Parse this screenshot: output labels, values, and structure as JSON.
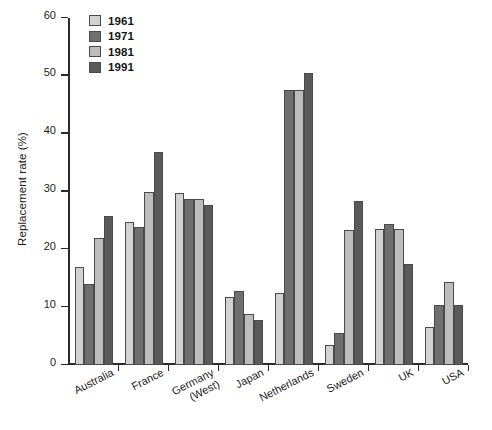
{
  "chart_data": {
    "type": "bar",
    "title": "",
    "xlabel": "",
    "ylabel": "Replacement rate (%)",
    "ylim": [
      0,
      60
    ],
    "yticks": [
      0,
      10,
      20,
      30,
      40,
      50,
      60
    ],
    "ytick_labels": [
      "0",
      "10",
      "20",
      "30",
      "40",
      "50",
      "60"
    ],
    "grid": false,
    "legend_position": "top-left",
    "categories": [
      "Australia",
      "France",
      "Germany\n(West)",
      "Japan",
      "Netherlands",
      "Sweden",
      "UK",
      "USA"
    ],
    "series": [
      {
        "name": "1961",
        "color": "#d2d2d2",
        "values": [
          17.0,
          24.8,
          29.8,
          11.8,
          12.5,
          3.5,
          23.5,
          6.5
        ]
      },
      {
        "name": "1971",
        "color": "#6f6f6f",
        "values": [
          14.0,
          23.8,
          28.7,
          12.8,
          47.5,
          5.5,
          24.3,
          10.4
        ]
      },
      {
        "name": "1981",
        "color": "#bdbdbd",
        "values": [
          21.9,
          29.9,
          28.7,
          8.8,
          47.5,
          23.4,
          23.5,
          14.4
        ]
      },
      {
        "name": "1991",
        "color": "#5a5a5a",
        "values": [
          25.8,
          36.8,
          27.6,
          7.8,
          50.5,
          28.4,
          17.4,
          10.4
        ]
      }
    ]
  },
  "axis": {
    "y_title": "Replacement rate (%)"
  }
}
